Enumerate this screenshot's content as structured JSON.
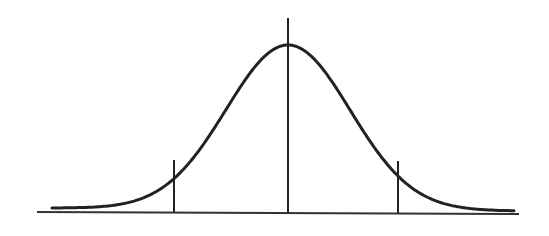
{
  "diagram": {
    "type": "normal-distribution-curve",
    "colors": {
      "background": "#ffffff",
      "stroke": "#222222",
      "axis": "#333333"
    },
    "baseline": {
      "x1": 37,
      "y1": 212,
      "x2": 519,
      "y2": 214
    },
    "curve": {
      "x_start": 52,
      "x_end": 515,
      "peak_x": 288,
      "peak_y": 45,
      "base_y_left": 208,
      "base_y_right": 211,
      "sigma_px": 62
    },
    "markers": [
      {
        "name": "left-marker",
        "x": 174,
        "y_top": 160,
        "y_bottom": 212
      },
      {
        "name": "center-marker",
        "x": 288,
        "y_top": 18,
        "y_bottom": 213
      },
      {
        "name": "right-marker",
        "x": 398,
        "y_top": 161,
        "y_bottom": 213
      }
    ]
  }
}
